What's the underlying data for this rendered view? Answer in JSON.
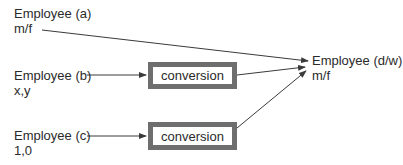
{
  "sources": [
    {
      "name": "Employee (a)",
      "value": "m/f"
    },
    {
      "name": "Employee (b)",
      "value": "x,y"
    },
    {
      "name": "Employee (c)",
      "value": "1,0"
    }
  ],
  "conversions": [
    {
      "label": "conversion"
    },
    {
      "label": "conversion"
    }
  ],
  "target": {
    "name": "Employee (d/w)",
    "value": "m/f"
  },
  "colors": {
    "line": "#3a3a3a",
    "box_border": "#6e6e6e",
    "text": "#2a2a2a"
  }
}
